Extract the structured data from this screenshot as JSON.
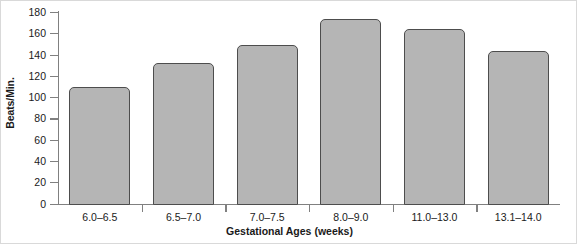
{
  "chart_data": {
    "type": "bar",
    "title": "",
    "subtitle": "",
    "xlabel": "Gestational Ages (weeks)",
    "ylabel": "Beats/Min.",
    "categories": [
      "6.0–6.5",
      "6.5–7.0",
      "7.0–7.5",
      "8.0–9.0",
      "11.0–13.0",
      "13.1–14.0"
    ],
    "values": [
      110,
      132,
      149,
      173,
      164,
      143
    ],
    "ylim": [
      0,
      180
    ],
    "yticks": [
      0,
      20,
      40,
      60,
      80,
      100,
      120,
      140,
      160,
      180
    ],
    "ytick_labels": [
      "0",
      "20",
      "40",
      "60",
      "80",
      "100",
      "120",
      "140",
      "160",
      "180"
    ],
    "grid": false,
    "legend": null,
    "legend_position": "none",
    "bar_fill_color": "#b5b5b5",
    "bar_edge_color": "#4d4d4d",
    "axis_color": "#808080",
    "text_color": "#1a1a1a",
    "background_color": "#ffffff"
  }
}
